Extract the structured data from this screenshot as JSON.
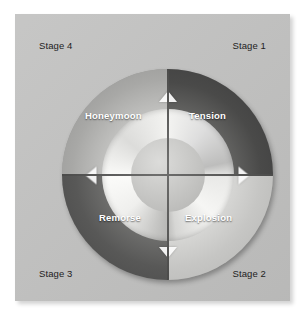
{
  "diagram": {
    "type": "cycle-wheel",
    "background_color": "#ffffff",
    "card_color": "#c0c0bf",
    "label_color": "#1d1d1d",
    "phase_label_color": "#ffffff",
    "stages": [
      {
        "id": "stage-1",
        "label": "Stage 1",
        "position": "top-right",
        "phase": "Tension",
        "quadrant_color": "#4a4a49"
      },
      {
        "id": "stage-2",
        "label": "Stage 2",
        "position": "bottom-right",
        "phase": "Explosion",
        "quadrant_color": "#c6c6c4"
      },
      {
        "id": "stage-3",
        "label": "Stage 3",
        "position": "bottom-left",
        "phase": "Remorse",
        "quadrant_color": "#585857"
      },
      {
        "id": "stage-4",
        "label": "Stage 4",
        "position": "top-left",
        "phase": "Honeymoon",
        "quadrant_color": "#a8a8a6"
      }
    ],
    "phases": [
      {
        "id": "phase-tension",
        "label": "Tension"
      },
      {
        "id": "phase-explosion",
        "label": "Explosion"
      },
      {
        "id": "phase-remorse",
        "label": "Remorse"
      },
      {
        "id": "phase-honeymoon",
        "label": "Honeymoon"
      }
    ],
    "flow_direction": "clockwise",
    "arrows": [
      {
        "id": "arrow-top",
        "direction": "clockwise",
        "position": "top"
      },
      {
        "id": "arrow-right",
        "direction": "clockwise",
        "position": "right"
      },
      {
        "id": "arrow-bottom",
        "direction": "clockwise",
        "position": "bottom"
      },
      {
        "id": "arrow-left",
        "direction": "clockwise",
        "position": "left"
      }
    ]
  }
}
